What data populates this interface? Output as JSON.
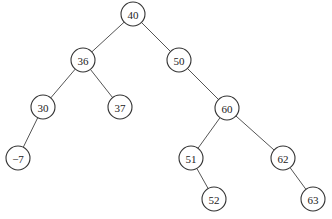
{
  "diagram": {
    "type": "binary-search-tree",
    "node_radius": 12,
    "nodes": [
      {
        "id": "n40",
        "label": "40",
        "x": 133,
        "y": 14
      },
      {
        "id": "n36",
        "label": "36",
        "x": 83,
        "y": 60
      },
      {
        "id": "n50",
        "label": "50",
        "x": 179,
        "y": 60
      },
      {
        "id": "n30",
        "label": "30",
        "x": 43,
        "y": 107
      },
      {
        "id": "n37",
        "label": "37",
        "x": 120,
        "y": 107
      },
      {
        "id": "n60",
        "label": "60",
        "x": 227,
        "y": 108
      },
      {
        "id": "nm7",
        "label": "−7",
        "x": 18,
        "y": 158
      },
      {
        "id": "n51",
        "label": "51",
        "x": 191,
        "y": 158
      },
      {
        "id": "n62",
        "label": "62",
        "x": 283,
        "y": 158
      },
      {
        "id": "n52",
        "label": "52",
        "x": 214,
        "y": 199
      },
      {
        "id": "n63",
        "label": "63",
        "x": 313,
        "y": 199
      }
    ],
    "edges": [
      {
        "from": "n40",
        "to": "n36"
      },
      {
        "from": "n40",
        "to": "n50"
      },
      {
        "from": "n36",
        "to": "n30"
      },
      {
        "from": "n36",
        "to": "n37"
      },
      {
        "from": "n50",
        "to": "n60"
      },
      {
        "from": "n30",
        "to": "nm7"
      },
      {
        "from": "n60",
        "to": "n51"
      },
      {
        "from": "n60",
        "to": "n62"
      },
      {
        "from": "n51",
        "to": "n52"
      },
      {
        "from": "n62",
        "to": "n63"
      }
    ]
  }
}
